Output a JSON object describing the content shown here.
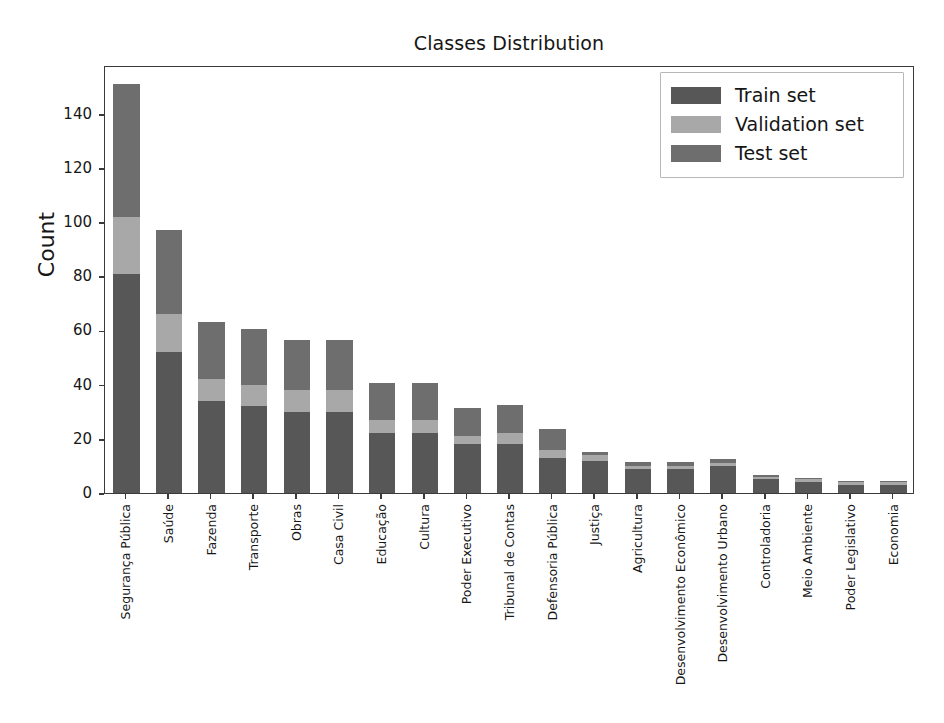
{
  "chart_data": {
    "type": "bar",
    "subtype": "stacked-vertical-bar",
    "title": "Classes Distribution",
    "xlabel": "",
    "ylabel": "Count",
    "ylim": [
      0,
      158
    ],
    "yticks": [
      0,
      20,
      40,
      60,
      80,
      100,
      120,
      140
    ],
    "ytick_labels": [
      "0",
      "20",
      "40",
      "60",
      "80",
      "100",
      "120",
      "140"
    ],
    "grid": false,
    "legend_position": "upper right",
    "categories": [
      "Segurança Pública",
      "Saúde",
      "Fazenda",
      "Transporte",
      "Obras",
      "Casa Civil",
      "Educação",
      "Cultura",
      "Poder Executivo",
      "Tribunal de Contas",
      "Defensoria Pública",
      "Justiça",
      "Agricultura",
      "Desenvolvimento Econômico",
      "Desenvolvimento Urbano",
      "Controladoria",
      "Meio Ambiente",
      "Poder Legislativo",
      "Economia"
    ],
    "series": [
      {
        "name": "Train set",
        "color": "#575757",
        "values": [
          81,
          52,
          34,
          32,
          30,
          30,
          22,
          22,
          18,
          18,
          13,
          12,
          9,
          9,
          10,
          5,
          4,
          3,
          3
        ]
      },
      {
        "name": "Validation set",
        "color": "#a8a8a8",
        "values": [
          21,
          14,
          8,
          8,
          8,
          8,
          5,
          5,
          3,
          4,
          3,
          2,
          1,
          1,
          1,
          1,
          1,
          1,
          1
        ]
      },
      {
        "name": "Test set",
        "color": "#6e6e6e",
        "values": [
          49,
          31,
          21,
          20.5,
          18.5,
          18.5,
          13.5,
          13.5,
          10.5,
          10.5,
          7.5,
          1,
          1.5,
          1.5,
          1.5,
          0.5,
          0.5,
          0.5,
          0.5
        ]
      }
    ],
    "totals": [
      151,
      97,
      63,
      60.5,
      56.5,
      56.5,
      40.5,
      40.5,
      31.5,
      32.5,
      23.5,
      15,
      11.5,
      11.5,
      12.5,
      6.5,
      5.5,
      4.5,
      4.5
    ]
  },
  "legend": {
    "entries": [
      {
        "label": "Train set",
        "color": "#575757"
      },
      {
        "label": "Validation set",
        "color": "#a8a8a8"
      },
      {
        "label": "Test set",
        "color": "#6e6e6e"
      }
    ]
  },
  "axes": {
    "frame_color": "#3a3a3a",
    "tick_color": "#3a3a3a",
    "text_color": "#161616"
  },
  "background_color": "#ffffff"
}
